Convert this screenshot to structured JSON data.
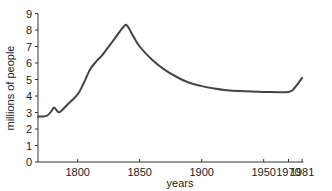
{
  "chart_data": {
    "type": "line",
    "title": "",
    "xlabel": "years",
    "ylabel": "millions of people",
    "xlim": [
      1768,
      1982
    ],
    "ylim": [
      0,
      9
    ],
    "grid": false,
    "legend": null,
    "x_ticks": [
      1800,
      1850,
      1900,
      1950,
      1970,
      1981
    ],
    "x_tick_labels": [
      "1800",
      "1850",
      "1900",
      "1950",
      "1970",
      "1981"
    ],
    "y_ticks": [
      0,
      1,
      2,
      3,
      4,
      5,
      6,
      7,
      8,
      9
    ],
    "y_tick_labels": [
      "0",
      "1",
      "2",
      "3",
      "4",
      "5",
      "6",
      "7",
      "8",
      "9"
    ],
    "series": [
      {
        "name": "population",
        "color": "#444444",
        "x": [
          1768,
          1775,
          1779,
          1781,
          1784,
          1786,
          1792,
          1800,
          1805,
          1810,
          1815,
          1820,
          1830,
          1837,
          1840,
          1845,
          1850,
          1860,
          1870,
          1880,
          1890,
          1900,
          1910,
          1920,
          1930,
          1950,
          1970,
          1975,
          1981
        ],
        "values": [
          2.75,
          2.8,
          3.1,
          3.3,
          3.05,
          3.05,
          3.5,
          4.1,
          4.8,
          5.6,
          6.1,
          6.5,
          7.5,
          8.2,
          8.25,
          7.6,
          7.0,
          6.2,
          5.6,
          5.15,
          4.8,
          4.6,
          4.45,
          4.35,
          4.3,
          4.25,
          4.25,
          4.5,
          5.1
        ]
      }
    ]
  }
}
